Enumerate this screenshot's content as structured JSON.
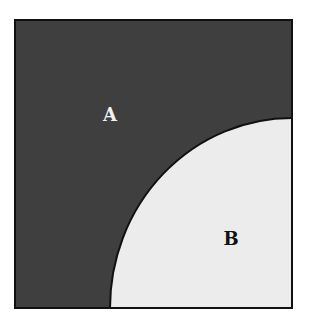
{
  "diagram": {
    "regions": [
      {
        "id": "A",
        "label": "A",
        "fill": "#3f3f3f",
        "description": "dark region outside the quarter-circle"
      },
      {
        "id": "B",
        "label": "B",
        "fill": "#ececec",
        "description": "light quarter-circle region at bottom-right corner"
      }
    ],
    "colors": {
      "background": "#ffffff",
      "border": "#111111",
      "region_a": "#3f3f3f",
      "region_b": "#ececec",
      "label_a": "#f2f2f2",
      "label_b": "#111111"
    }
  }
}
